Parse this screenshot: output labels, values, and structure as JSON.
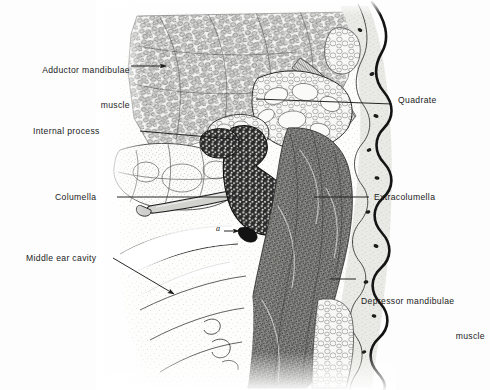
{
  "figure": {
    "kind": "anatomical-histology-illustration",
    "background_color": "#fdfdfd",
    "ink_color": "#1f1f1f",
    "width": 490,
    "height": 390
  },
  "labels": [
    {
      "id": "adductor-mandibulae",
      "line1": "Adductor mandibulae",
      "line2": "muscle",
      "align": "right",
      "x": 12,
      "y": 42,
      "leader": {
        "x1": 131,
        "y1": 66,
        "x2": 167,
        "y2": 66,
        "arrow": "right"
      }
    },
    {
      "id": "internal-process",
      "line1": "Internal process",
      "line2": "",
      "align": "right",
      "x": 33,
      "y": 126,
      "leader": {
        "x1": 140,
        "y1": 131,
        "x2": 243,
        "y2": 140,
        "arrow": "none"
      }
    },
    {
      "id": "columella",
      "line1": "Columella",
      "line2": "",
      "align": "right",
      "x": 55,
      "y": 192,
      "leader": {
        "x1": 117,
        "y1": 197,
        "x2": 243,
        "y2": 197,
        "arrow": "none"
      }
    },
    {
      "id": "middle-ear-cavity",
      "line1": "Middle ear cavity",
      "line2": "",
      "align": "right",
      "x": 26,
      "y": 258,
      "leader": {
        "x1": 113,
        "y1": 258,
        "x2": 175,
        "y2": 295,
        "arrow": "right"
      }
    },
    {
      "id": "quadrate",
      "line1": "Quadrate",
      "line2": "",
      "align": "left",
      "x": 398,
      "y": 99,
      "leader": {
        "x1": 392,
        "y1": 104,
        "x2": 256,
        "y2": 99,
        "arrow": "none"
      }
    },
    {
      "id": "extracolumella",
      "line1": "Extracolumella",
      "line2": "",
      "align": "left",
      "x": 374,
      "y": 192,
      "leader": {
        "x1": 369,
        "y1": 197,
        "x2": 314,
        "y2": 197,
        "arrow": "none"
      }
    },
    {
      "id": "depressor-mandibulae",
      "line1": "Depressor mandibulae",
      "line2": "muscle",
      "align": "left",
      "x": 361,
      "y": 273,
      "leader": {
        "x1": 356,
        "y1": 279,
        "x2": 330,
        "y2": 279,
        "arrow": "none"
      }
    }
  ],
  "annotations": [
    {
      "id": "point-a",
      "text": "a",
      "x": 216,
      "y": 228,
      "leader": {
        "x1": 224,
        "y1": 231,
        "x2": 240,
        "y2": 231,
        "arrow": "right"
      }
    }
  ]
}
